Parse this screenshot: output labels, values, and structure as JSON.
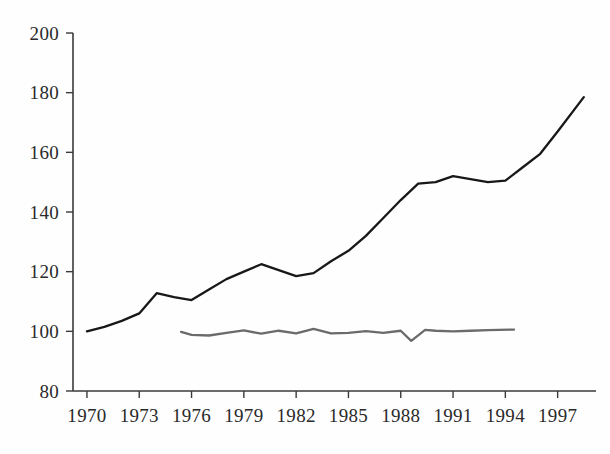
{
  "chart_data": {
    "type": "line",
    "title": "",
    "subtitle": "",
    "xlabel": "",
    "ylabel": "",
    "xlim": [
      1969.2,
      1999.2
    ],
    "ylim": [
      80,
      200
    ],
    "grid": false,
    "legend": "none",
    "xticks": [
      1970,
      1973,
      1976,
      1979,
      1982,
      1985,
      1988,
      1991,
      1994,
      1997
    ],
    "xtick_labels": [
      "1970",
      "1973",
      "1976",
      "1979",
      "1982",
      "1985",
      "1988",
      "1991",
      "1994",
      "1997"
    ],
    "yticks": [
      80,
      100,
      120,
      140,
      160,
      180,
      200
    ],
    "ytick_labels": [
      "80",
      "100",
      "120",
      "140",
      "160",
      "180",
      "200"
    ],
    "series": [
      {
        "name": "upper-line",
        "color": "#181818",
        "x": [
          1970,
          1971,
          1972,
          1973,
          1974,
          1975,
          1976,
          1977,
          1978,
          1979,
          1980,
          1981,
          1982,
          1983,
          1984,
          1985,
          1986,
          1987,
          1988,
          1989,
          1990,
          1991,
          1992,
          1993,
          1994,
          1995,
          1996,
          1997,
          1998.5
        ],
        "values": [
          100,
          101.5,
          103.5,
          106,
          112.8,
          111.5,
          110.5,
          114,
          117.5,
          120,
          122.5,
          120.5,
          118.5,
          119.5,
          123.5,
          127,
          132,
          138,
          144,
          149.5,
          150,
          152,
          151,
          150,
          150.5,
          155,
          159.5,
          167,
          178.5
        ]
      },
      {
        "name": "lower-line",
        "color": "#6b6b6b",
        "x": [
          1975.4,
          1976,
          1977,
          1978,
          1979,
          1980,
          1981,
          1982,
          1983,
          1984,
          1985,
          1986,
          1987,
          1988,
          1988.6,
          1989.4,
          1990,
          1991,
          1992,
          1993,
          1994.5
        ],
        "values": [
          99.8,
          98.8,
          98.6,
          99.5,
          100.3,
          99.2,
          100.2,
          99.3,
          100.8,
          99.3,
          99.5,
          100.1,
          99.5,
          100.2,
          96.8,
          100.5,
          100.2,
          100.0,
          100.2,
          100.4,
          100.6
        ]
      }
    ]
  },
  "geometry": {
    "plot_left": 73,
    "plot_right": 596,
    "plot_top": 33,
    "plot_bottom": 391
  }
}
